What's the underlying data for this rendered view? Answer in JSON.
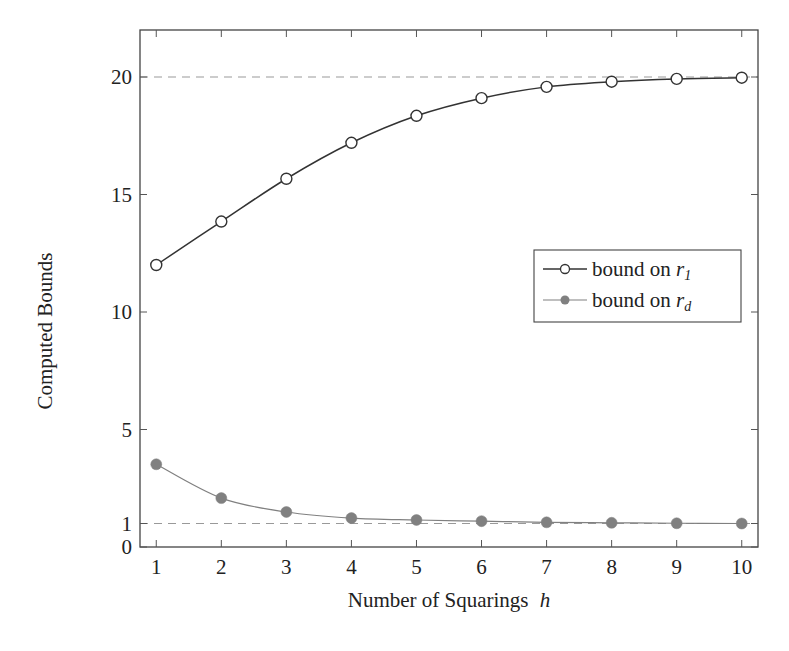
{
  "chart_data": {
    "type": "line",
    "title": "",
    "xlabel": "Number of Squarings",
    "xlabel_var": "h",
    "ylabel": "Computed Bounds",
    "xlim": [
      0.75,
      10.25
    ],
    "ylim": [
      0,
      22
    ],
    "x": [
      1,
      2,
      3,
      4,
      5,
      6,
      7,
      8,
      9,
      10
    ],
    "xticks": [
      1,
      2,
      3,
      4,
      5,
      6,
      7,
      8,
      9,
      10
    ],
    "yticks": [
      0,
      1,
      5,
      10,
      15,
      20
    ],
    "grid": false,
    "reference_lines": [
      {
        "y": 20,
        "style": "dashed",
        "color": "#999999"
      },
      {
        "y": 1,
        "style": "dashed",
        "color": "#999999"
      }
    ],
    "legend_position": "center right",
    "series": [
      {
        "name": "bound on r_1",
        "label_text": "bound on ",
        "label_var": "r",
        "label_sub": "1",
        "marker": "open-circle",
        "color": "#333333",
        "values": [
          12.0,
          13.85,
          15.67,
          17.2,
          18.35,
          19.1,
          19.58,
          19.8,
          19.92,
          19.97
        ]
      },
      {
        "name": "bound on r_d",
        "label_text": "bound on ",
        "label_var": "r",
        "label_sub": "d",
        "marker": "filled-circle",
        "color": "#808080",
        "values": [
          3.52,
          2.08,
          1.49,
          1.23,
          1.15,
          1.1,
          1.05,
          1.03,
          1.01,
          1.0
        ]
      }
    ]
  }
}
